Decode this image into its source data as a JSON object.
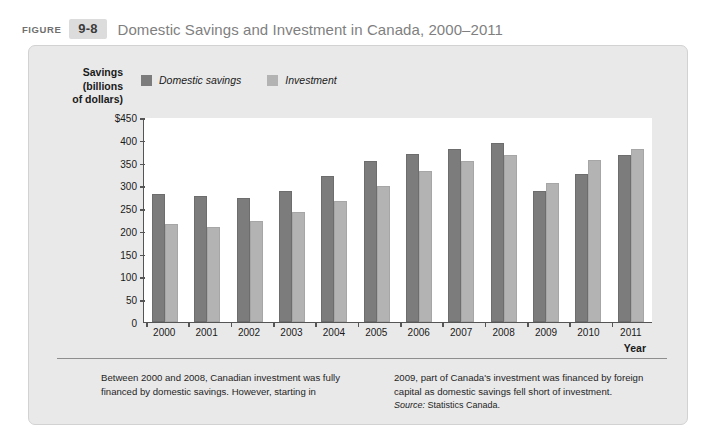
{
  "figure": {
    "label": "FIGURE",
    "number": "9-8",
    "title": "Domestic Savings and Investment in Canada, 2000–2011"
  },
  "axis": {
    "y_title": "Savings\n(billions\nof dollars)",
    "x_title": "Year"
  },
  "legend": {
    "items": [
      {
        "label": "Domestic savings",
        "color": "#7c7c7c"
      },
      {
        "label": "Investment",
        "color": "#b3b3b3"
      }
    ]
  },
  "caption": {
    "left": "Between 2000 and 2008, Canadian investment was fully financed by domestic savings. However, starting in",
    "right": "2009, part of Canada's investment was financed by foreign capital as domestic savings fell short of investment.",
    "source_label": "Source:",
    "source_value": "Statistics Canada."
  },
  "chart_data": {
    "type": "bar",
    "title": "Domestic Savings and Investment in Canada, 2000–2011",
    "xlabel": "Year",
    "ylabel": "Savings (billions of dollars)",
    "ylim": [
      0,
      450
    ],
    "ytick_labels": [
      "$450",
      "400",
      "350",
      "300",
      "250",
      "200",
      "150",
      "100",
      "50",
      "0"
    ],
    "yticks": [
      450,
      400,
      350,
      300,
      250,
      200,
      150,
      100,
      50,
      0
    ],
    "grid": false,
    "legend_position": "top-left",
    "categories": [
      "2000",
      "2001",
      "2002",
      "2003",
      "2004",
      "2005",
      "2006",
      "2007",
      "2008",
      "2009",
      "2010",
      "2011"
    ],
    "series": [
      {
        "name": "Domestic savings",
        "color": "#7c7c7c",
        "values": [
          280,
          277,
          272,
          287,
          320,
          353,
          369,
          379,
          393,
          288,
          326,
          366
        ]
      },
      {
        "name": "Investment",
        "color": "#b3b3b3",
        "values": [
          215,
          209,
          221,
          241,
          265,
          299,
          331,
          353,
          367,
          305,
          355,
          380
        ]
      }
    ]
  }
}
